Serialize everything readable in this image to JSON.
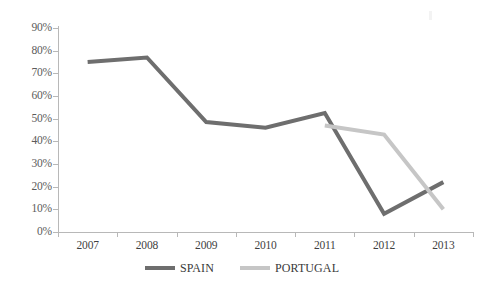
{
  "chart_data": {
    "type": "line",
    "title": "",
    "subtitle": "",
    "xlabel": "",
    "ylabel": "",
    "categories": [
      "2007",
      "2008",
      "2009",
      "2010",
      "2011",
      "2012",
      "2013"
    ],
    "ylim": [
      0,
      90
    ],
    "ytick_labels": [
      "0%",
      "10%",
      "20%",
      "30%",
      "40%",
      "50%",
      "60%",
      "70%",
      "80%",
      "90%"
    ],
    "ytick_values": [
      0,
      10,
      20,
      30,
      40,
      50,
      60,
      70,
      80,
      90
    ],
    "grid": false,
    "legend_position": "bottom",
    "series": [
      {
        "name": "SPAIN",
        "color": "#6e6e6e",
        "values": [
          75,
          77,
          48.5,
          46,
          52.5,
          8,
          22
        ]
      },
      {
        "name": "PORTUGAL",
        "color": "#c6c6c6",
        "values": [
          null,
          null,
          null,
          null,
          47,
          43,
          10
        ]
      }
    ]
  },
  "legend": {
    "entries": [
      {
        "label": "SPAIN",
        "color": "#6e6e6e"
      },
      {
        "label": "PORTUGAL",
        "color": "#c6c6c6"
      }
    ]
  },
  "axes": {
    "y_axis_color": "#b8b8b8",
    "x_axis_color": "#b8b8b8"
  }
}
